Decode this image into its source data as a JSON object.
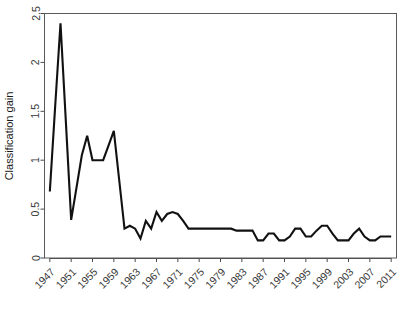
{
  "chart_data": {
    "type": "line",
    "title": "",
    "xlabel": "",
    "ylabel": "Classification gain",
    "xlim": [
      1946,
      2012
    ],
    "ylim": [
      0,
      2.5
    ],
    "grid": false,
    "legend": null,
    "y_ticks": [
      "0",
      "0.5",
      "1",
      "1.5",
      "2",
      "2.5"
    ],
    "y_tick_values": [
      0,
      0.5,
      1.0,
      1.5,
      2.0,
      2.5
    ],
    "x_ticks": [
      "1947",
      "1951",
      "1955",
      "1959",
      "1963",
      "1967",
      "1971",
      "1975",
      "1979",
      "1983",
      "1987",
      "1991",
      "1995",
      "1999",
      "2003",
      "2007",
      "2011"
    ],
    "x_tick_values": [
      1947,
      1951,
      1955,
      1959,
      1963,
      1967,
      1971,
      1975,
      1979,
      1983,
      1987,
      1991,
      1995,
      1999,
      2003,
      2007,
      2011
    ],
    "x": [
      1947,
      1948,
      1949,
      1950,
      1951,
      1952,
      1953,
      1954,
      1955,
      1956,
      1957,
      1958,
      1959,
      1960,
      1961,
      1962,
      1963,
      1964,
      1965,
      1966,
      1967,
      1968,
      1969,
      1970,
      1971,
      1972,
      1973,
      1974,
      1975,
      1976,
      1977,
      1978,
      1979,
      1980,
      1981,
      1982,
      1983,
      1984,
      1985,
      1986,
      1987,
      1988,
      1989,
      1990,
      1991,
      1992,
      1993,
      1994,
      1995,
      1996,
      1997,
      1998,
      1999,
      2000,
      2001,
      2002,
      2003,
      2004,
      2005,
      2006,
      2007,
      2008,
      2009,
      2010,
      2011
    ],
    "values": [
      0.68,
      1.55,
      2.4,
      1.4,
      0.39,
      0.72,
      1.05,
      1.25,
      1.0,
      1.0,
      1.0,
      1.15,
      1.3,
      0.8,
      0.3,
      0.33,
      0.3,
      0.2,
      0.38,
      0.3,
      0.47,
      0.38,
      0.45,
      0.47,
      0.45,
      0.38,
      0.3,
      0.3,
      0.3,
      0.3,
      0.3,
      0.3,
      0.3,
      0.3,
      0.3,
      0.28,
      0.28,
      0.28,
      0.28,
      0.18,
      0.18,
      0.25,
      0.25,
      0.18,
      0.18,
      0.22,
      0.3,
      0.3,
      0.22,
      0.22,
      0.28,
      0.33,
      0.33,
      0.25,
      0.18,
      0.18,
      0.18,
      0.25,
      0.3,
      0.22,
      0.18,
      0.18,
      0.22,
      0.22,
      0.22
    ],
    "series": [
      {
        "name": "Classification gain",
        "color": "#111111",
        "values": [
          0.68,
          1.55,
          2.4,
          1.4,
          0.39,
          0.72,
          1.05,
          1.25,
          1.0,
          1.0,
          1.0,
          1.15,
          1.3,
          0.8,
          0.3,
          0.33,
          0.3,
          0.2,
          0.38,
          0.3,
          0.47,
          0.38,
          0.45,
          0.47,
          0.45,
          0.38,
          0.3,
          0.3,
          0.3,
          0.3,
          0.3,
          0.3,
          0.3,
          0.3,
          0.3,
          0.28,
          0.28,
          0.28,
          0.28,
          0.18,
          0.18,
          0.25,
          0.25,
          0.18,
          0.18,
          0.22,
          0.3,
          0.3,
          0.22,
          0.22,
          0.28,
          0.33,
          0.33,
          0.25,
          0.18,
          0.18,
          0.18,
          0.25,
          0.3,
          0.22,
          0.18,
          0.18,
          0.22,
          0.22,
          0.22
        ]
      }
    ]
  },
  "axes": {
    "y_title": "Classification gain"
  },
  "style": {
    "line_color": "#111111",
    "frame_color": "#5a5a5a",
    "text_color": "#3a3a3a",
    "background": "#ffffff"
  }
}
